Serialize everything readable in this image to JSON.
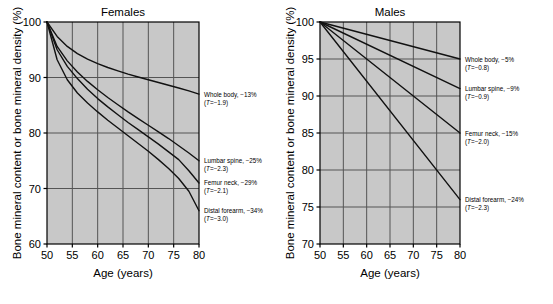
{
  "figure": {
    "background": "#ffffff",
    "plot_background": "#c8c8c8",
    "grid_color": "#555555",
    "curve_color": "#111111",
    "axis_color": "#000000"
  },
  "chart_data": [
    {
      "type": "line",
      "title": "Females",
      "xlabel": "Age (years)",
      "ylabel": "Bone mineral content or bone mineral density (%)",
      "xlim": [
        50,
        80
      ],
      "ylim": [
        60,
        100
      ],
      "xticks": [
        50,
        55,
        60,
        65,
        70,
        75,
        80
      ],
      "yticks": [
        60,
        70,
        80,
        90,
        100
      ],
      "grid": true,
      "legend": "inline-right-annotations",
      "x": [
        50,
        52,
        54,
        56,
        58,
        60,
        62,
        64,
        66,
        68,
        70,
        72,
        74,
        76,
        78,
        80
      ],
      "series": [
        {
          "name": "Whole body",
          "change_label": "Whole body, −13%",
          "t_score_label": "(T=−1.9)",
          "t_score": -1.9,
          "total_change_pct": -13,
          "end_value": 87,
          "values": [
            100,
            97.4,
            95.6,
            94.3,
            93.3,
            92.5,
            91.8,
            91.2,
            90.6,
            90.1,
            89.6,
            89.1,
            88.6,
            88.1,
            87.6,
            87.0
          ]
        },
        {
          "name": "Lumbar spine",
          "change_label": "Lumbar spine, −25%",
          "t_score_label": "(T=−2.3)",
          "t_score": -2.3,
          "total_change_pct": -25,
          "end_value": 75,
          "values": [
            100,
            95.6,
            93.0,
            91.0,
            89.3,
            87.8,
            86.4,
            85.1,
            83.8,
            82.6,
            81.4,
            80.2,
            79.0,
            77.7,
            76.4,
            75.0
          ]
        },
        {
          "name": "Femur neck",
          "change_label": "Femur neck, −29%",
          "t_score_label": "(T=−2.1)",
          "t_score": -2.1,
          "total_change_pct": -29,
          "end_value": 71,
          "values": [
            100,
            95.0,
            92.0,
            89.8,
            87.9,
            86.2,
            84.7,
            83.3,
            81.9,
            80.6,
            79.3,
            78.0,
            76.6,
            75.2,
            73.2,
            71.0
          ]
        },
        {
          "name": "Distal forearm",
          "change_label": "Distal forearm, −34%",
          "t_score_label": "(T=−3.0)",
          "t_score": -3.0,
          "total_change_pct": -34,
          "end_value": 66,
          "values": [
            100,
            93.2,
            89.6,
            87.2,
            85.4,
            83.8,
            82.3,
            80.9,
            79.5,
            78.1,
            76.7,
            75.2,
            73.6,
            71.8,
            69.5,
            66.0
          ]
        }
      ]
    },
    {
      "type": "line",
      "title": "Males",
      "xlabel": "Age (years)",
      "ylabel": "Bone mineral content or bone mineral density (%)",
      "xlim": [
        50,
        80
      ],
      "ylim": [
        70,
        100
      ],
      "xticks": [
        50,
        55,
        60,
        65,
        70,
        75,
        80
      ],
      "yticks": [
        70,
        75,
        80,
        85,
        90,
        95,
        100
      ],
      "grid": true,
      "legend": "inline-right-annotations",
      "x": [
        50,
        80
      ],
      "series": [
        {
          "name": "Whole body",
          "change_label": "Whole body, −5%",
          "t_score_label": "(T=−0.8)",
          "t_score": -0.8,
          "total_change_pct": -5,
          "end_value": 95,
          "values": [
            100,
            95
          ]
        },
        {
          "name": "Lumbar spine",
          "change_label": "Lumbar spine, −9%",
          "t_score_label": "(T=−0.9)",
          "t_score": -0.9,
          "total_change_pct": -9,
          "end_value": 91,
          "values": [
            100,
            91
          ]
        },
        {
          "name": "Femur neck",
          "change_label": "Femur neck, −15%",
          "t_score_label": "(T=−2.0)",
          "t_score": -2.0,
          "total_change_pct": -15,
          "end_value": 85,
          "values": [
            100,
            85
          ]
        },
        {
          "name": "Distal forearm",
          "change_label": "Distal forearm, −24%",
          "t_score_label": "(T=−2.3)",
          "t_score": -2.3,
          "total_change_pct": -24,
          "end_value": 76,
          "values": [
            100,
            76
          ]
        }
      ]
    }
  ]
}
